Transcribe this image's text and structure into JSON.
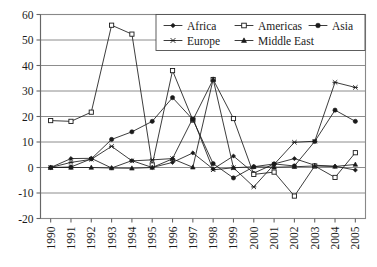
{
  "chart_data": {
    "type": "line",
    "title": "",
    "xlabel": "",
    "ylabel": "",
    "xlim": [
      1990,
      2005
    ],
    "ylim": [
      -20,
      60
    ],
    "yticks": [
      -20,
      -10,
      0,
      10,
      20,
      30,
      40,
      50,
      60
    ],
    "grid": true,
    "legend_position": "top-right",
    "categories": [
      1990,
      1991,
      1992,
      1993,
      1994,
      1995,
      1996,
      1997,
      1998,
      1999,
      2000,
      2001,
      2002,
      2003,
      2004,
      2005
    ],
    "x_tick_labels": [
      "1990",
      "1991",
      "1992",
      "1993",
      "1994",
      "1995",
      "1996",
      "1997",
      "1998",
      "1999",
      "2000",
      "2001",
      "2002",
      "2003",
      "2004",
      "2005"
    ],
    "y_tick_labels": [
      "60",
      "50",
      "40",
      "30",
      "20",
      "10",
      "0",
      "-10",
      "-20"
    ],
    "series": [
      {
        "name": "Africa",
        "marker": "diamond-filled",
        "values": [
          0.0,
          3.5,
          3.6,
          -0.2,
          2.7,
          0.0,
          2.0,
          5.7,
          -0.6,
          4.5,
          -2.2,
          1.4,
          3.5,
          0.9,
          0.5,
          -1.0
        ]
      },
      {
        "name": "Americas",
        "marker": "square-open",
        "values": [
          18.4,
          18.1,
          21.7,
          55.8,
          52.3,
          1.0,
          38.0,
          18.6,
          34.5,
          19.2,
          -2.7,
          -1.8,
          -11.2,
          0.6,
          -3.9,
          5.8
        ]
      },
      {
        "name": "Asia",
        "marker": "circle-filled",
        "values": [
          0.0,
          0.2,
          3.4,
          11.0,
          14.0,
          18.1,
          27.4,
          18.8,
          1.5,
          -4.1,
          0.3,
          1.4,
          0.6,
          10.2,
          22.5,
          18.1
        ]
      },
      {
        "name": "Europe",
        "marker": "cross",
        "values": [
          0.0,
          2.0,
          3.2,
          8.3,
          2.6,
          3.0,
          3.5,
          19.3,
          -0.9,
          -0.1,
          -7.6,
          1.2,
          9.9,
          10.3,
          33.4,
          31.4
        ]
      },
      {
        "name": "Middle East",
        "marker": "triangle-filled",
        "values": [
          0.0,
          0.0,
          0.0,
          -0.2,
          -0.3,
          0.0,
          3.4,
          0.1,
          34.6,
          -0.1,
          0.3,
          0.1,
          0.3,
          0.6,
          0.4,
          1.2
        ]
      }
    ],
    "legend_entries": [
      "Africa",
      "Americas",
      "Asia",
      "Europe",
      "Middle East"
    ],
    "colors": {
      "series": "#1a1a1a",
      "grid": "#808080",
      "axis": "#666666",
      "background": "#ffffff"
    }
  }
}
